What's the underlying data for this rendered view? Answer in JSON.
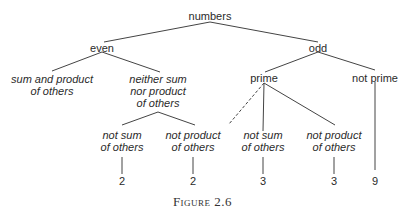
{
  "tree": {
    "root": "numbers",
    "even": "even",
    "odd": "odd",
    "sum_and_product_l1": "sum and product",
    "sum_and_product_l2": "of others",
    "neither_l1": "neither sum",
    "neither_l2": "nor product",
    "neither_l3": "of others",
    "prime": "prime",
    "not_prime": "not prime",
    "ns1_l1": "not sum",
    "ns1_l2": "of others",
    "np1_l1": "not product",
    "np1_l2": "of others",
    "ns2_l1": "not sum",
    "ns2_l2": "of others",
    "np2_l1": "not product",
    "np2_l2": "of others",
    "leaf1": "2",
    "leaf2": "2",
    "leaf3": "3",
    "leaf4": "3",
    "leaf5": "9"
  },
  "caption": "Figure 2.6"
}
